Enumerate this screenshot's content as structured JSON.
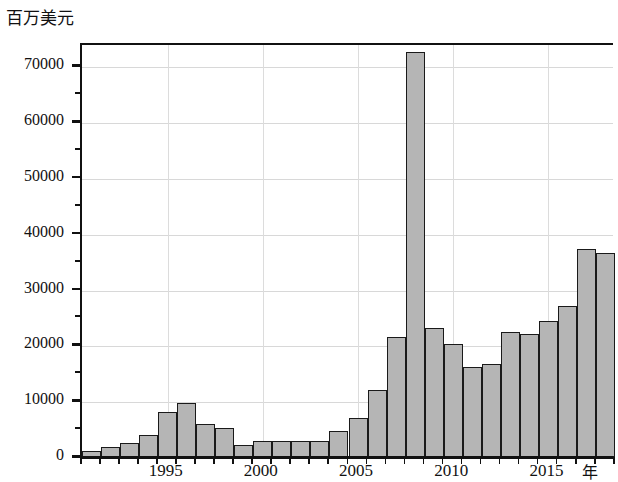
{
  "chart_data": {
    "type": "bar",
    "title": "",
    "ylabel": "百万美元",
    "xlabel": "年",
    "ylim": [
      0,
      74000
    ],
    "xlim": [
      1990.5,
      2018.5
    ],
    "grid": true,
    "legend": null,
    "y_ticks_major": [
      0,
      10000,
      20000,
      30000,
      40000,
      50000,
      60000,
      70000
    ],
    "y_tick_labels": [
      "0",
      "10000",
      "20000",
      "30000",
      "40000",
      "50000",
      "60000",
      "70000"
    ],
    "y_ticks_minor": [
      5000,
      15000,
      25000,
      35000,
      45000,
      55000,
      65000
    ],
    "x_tick_labels": [
      "1995",
      "2000",
      "2005",
      "2010",
      "2015"
    ],
    "x_tick_values": [
      1995,
      2000,
      2005,
      2010,
      2015
    ],
    "categories": [
      "1991",
      "1992",
      "1993",
      "1994",
      "1995",
      "1996",
      "1997",
      "1998",
      "1999",
      "2000",
      "2001",
      "2002",
      "2003",
      "2004",
      "2005",
      "2006",
      "2007",
      "2008",
      "2009",
      "2010",
      "2011",
      "2012",
      "2013",
      "2014",
      "2015",
      "2016",
      "2017",
      "2018"
    ],
    "values": [
      1000,
      1800,
      2500,
      4000,
      8000,
      9700,
      6000,
      5200,
      2100,
      2800,
      2900,
      2900,
      2900,
      4600,
      7000,
      12000,
      21500,
      72500,
      23200,
      20200,
      16100,
      16600,
      22400,
      22100,
      24300,
      27000,
      37200,
      36500
    ],
    "bar_color": "#b5b5b5",
    "bar_edge_color": "#1a1a1a"
  },
  "axis": {
    "y_unit_caption": "百万美元",
    "x_unit_caption": "年"
  }
}
